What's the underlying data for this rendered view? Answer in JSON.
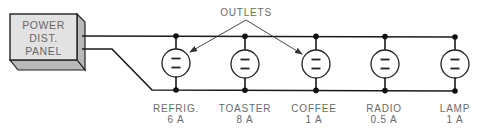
{
  "panel": {
    "lines": [
      "POWER",
      "DIST.",
      "PANEL"
    ],
    "front_color": "#e2e2e2",
    "side_color": "#b9b9b9"
  },
  "callout": {
    "label": "OUTLETS"
  },
  "wire_color": "#1a1a1a",
  "outlets": [
    {
      "name": "REFRIG.",
      "current": "6 A"
    },
    {
      "name": "TOASTER",
      "current": "8 A"
    },
    {
      "name": "COFFEE",
      "current": "1 A"
    },
    {
      "name": "RADIO",
      "current": "0.5 A"
    },
    {
      "name": "LAMP",
      "current": "1 A"
    }
  ]
}
